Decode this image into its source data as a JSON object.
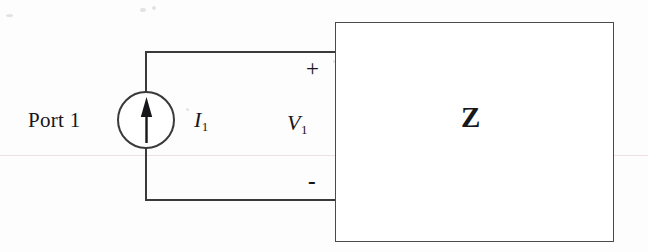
{
  "diagram": {
    "ink_color": "#3a3a3c",
    "background_color": "#fdfdfd",
    "labels": {
      "port": "Port 1",
      "current_symbol": "I",
      "current_subscript": "1",
      "voltage_symbol": "V",
      "voltage_subscript": "1",
      "impedance": "Z",
      "plus": "+",
      "minus": "-"
    },
    "elements": {
      "source_name": "current-source",
      "arrow_direction": "up",
      "block_name": "impedance-block"
    }
  }
}
